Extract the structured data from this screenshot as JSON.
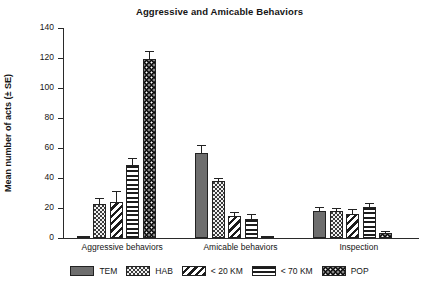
{
  "chart_data": {
    "type": "bar",
    "title": "Aggressive and Amicable Behaviors",
    "xlabel": "",
    "ylabel": "Mean number of acts (± SE)",
    "ylim": [
      0,
      140
    ],
    "yticks": [
      0,
      20,
      40,
      60,
      80,
      100,
      120,
      140
    ],
    "ytick_labels": [
      "0",
      "20",
      "40",
      "60",
      "80",
      "100",
      "120",
      "140"
    ],
    "grid": false,
    "legend_position": "bottom",
    "categories": [
      "Aggressive behaviors",
      "Amicable behaviors",
      "Inspection"
    ],
    "series": [
      {
        "name": "TEM",
        "pattern": "solid",
        "values": [
          1.5,
          57,
          18
        ],
        "errors": [
          0.5,
          4.5,
          1.8
        ]
      },
      {
        "name": "HAB",
        "pattern": "checker",
        "values": [
          23,
          38,
          18
        ],
        "errors": [
          3,
          1.5,
          1.5
        ]
      },
      {
        "name": "< 20 KM",
        "pattern": "diagonal",
        "values": [
          24,
          15,
          16
        ],
        "errors": [
          7,
          2,
          2.5
        ]
      },
      {
        "name": "< 70 KM",
        "pattern": "horizontal",
        "values": [
          49,
          13,
          21
        ],
        "errors": [
          4,
          2.5,
          1.5
        ]
      },
      {
        "name": "POP",
        "pattern": "dots",
        "values": [
          119.5,
          1.5,
          3.5
        ],
        "errors": [
          4.5,
          0.4,
          0.5
        ]
      }
    ]
  },
  "legend": {
    "items": [
      {
        "label": "TEM",
        "pattern": "solid"
      },
      {
        "label": "HAB",
        "pattern": "checker"
      },
      {
        "label": "< 20 KM",
        "pattern": "diagonal"
      },
      {
        "label": "< 70 KM",
        "pattern": "horizontal"
      },
      {
        "label": "POP",
        "pattern": "dots"
      }
    ]
  },
  "colors": {
    "axis": "#2a2a2a",
    "text": "#151515",
    "solid_fill": "#6e6e6e",
    "dark_fill": "#0d0d0d",
    "background": "#ffffff"
  }
}
